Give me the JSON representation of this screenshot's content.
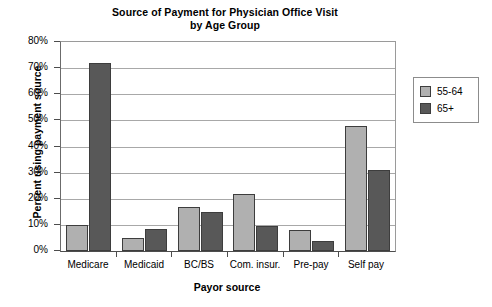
{
  "chart_data": {
    "type": "bar",
    "title": "Source of Payment for Physician Office Visit by Age Group",
    "title_line1": "Source of Payment for Physician Office Visit",
    "title_line2": "by Age Group",
    "xlabel": "Payor source",
    "ylabel": "Percent using payment source",
    "categories": [
      "Medicare",
      "Medicaid",
      "BC/BS",
      "Com. insur.",
      "Pre-pay",
      "Self pay"
    ],
    "series": [
      {
        "name": "55-64",
        "color": "#b0b0b0",
        "values": [
          10,
          5,
          17,
          22,
          8,
          48
        ]
      },
      {
        "name": "65+",
        "color": "#585858",
        "values": [
          72,
          8.5,
          15,
          9.5,
          4,
          31
        ]
      }
    ],
    "ylim": [
      0,
      80
    ],
    "ytick_values": [
      0,
      10,
      20,
      30,
      40,
      50,
      60,
      70,
      80
    ],
    "ytick_labels": [
      "0%",
      "10%",
      "20%",
      "30%",
      "40%",
      "50%",
      "60%",
      "70%",
      "80%"
    ],
    "grid": true,
    "legend_position": "right",
    "legend_entries": [
      "55-64",
      "65+"
    ]
  }
}
